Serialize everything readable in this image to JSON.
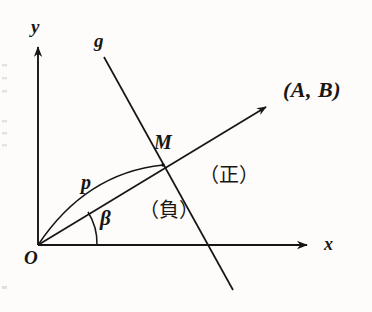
{
  "figure": {
    "type": "geometry-diagram",
    "background_color": "#fdfcfa",
    "ink_color": "#181512",
    "width": 372,
    "height": 312
  },
  "axes": {
    "x": {
      "label": "x",
      "origin": [
        38,
        245
      ],
      "tip": [
        315,
        245
      ]
    },
    "y": {
      "label": "y",
      "origin": [
        38,
        245
      ],
      "tip": [
        38,
        42
      ]
    },
    "origin_label": "O"
  },
  "lines": {
    "g": {
      "label": "g",
      "start": [
        104,
        57
      ],
      "end": [
        233,
        290
      ]
    },
    "ray": {
      "label": "(A, B)",
      "start": [
        38,
        245
      ],
      "end": [
        275,
        102
      ],
      "has_arrowhead": true
    },
    "arc_p": {
      "label": "p",
      "start": [
        38,
        245
      ],
      "end": [
        163,
        165
      ],
      "control": [
        88,
        176
      ]
    }
  },
  "points": {
    "M": {
      "label": "M",
      "position": [
        163,
        165
      ]
    },
    "O": {
      "label": "O",
      "position": [
        38,
        245
      ]
    }
  },
  "angle": {
    "label": "β",
    "vertex": [
      38,
      245
    ],
    "from_axis": "x",
    "radius": 59
  },
  "regions": [
    {
      "label": "（負）",
      "meaning": "negative",
      "position": [
        139,
        200
      ]
    },
    {
      "label": "（正）",
      "meaning": "positive",
      "position": [
        199,
        165
      ]
    }
  ]
}
